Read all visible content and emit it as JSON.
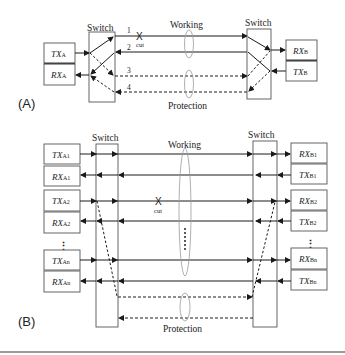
{
  "panel_a": {
    "label": "(A)",
    "switch_left_label": "Switch",
    "switch_right_label": "Switch",
    "working_label": "Working",
    "protection_label": "Protection",
    "cut_label": "cut",
    "cut_symbol": "X",
    "line_numbers": [
      "1",
      "2",
      "3",
      "4"
    ],
    "tx_a": {
      "main": "TX",
      "sub": "A"
    },
    "rx_a": {
      "main": "RX",
      "sub": "A"
    },
    "rx_b": {
      "main": "RX",
      "sub": "B"
    },
    "tx_b": {
      "main": "TX",
      "sub": "B"
    }
  },
  "panel_b": {
    "label": "(B)",
    "switch_left_label": "Switch",
    "switch_right_label": "Switch",
    "working_label": "Working",
    "protection_label": "Protection",
    "cut_label": "cut",
    "cut_symbol": "X",
    "left_units": [
      {
        "main": "TX",
        "sub": "A1"
      },
      {
        "main": "RX",
        "sub": "A1"
      },
      {
        "main": "TX",
        "sub": "A2"
      },
      {
        "main": "RX",
        "sub": "A2"
      },
      {
        "main": "TX",
        "sub": "An"
      },
      {
        "main": "RX",
        "sub": "An"
      }
    ],
    "right_units": [
      {
        "main": "RX",
        "sub": "B1"
      },
      {
        "main": "TX",
        "sub": "B1"
      },
      {
        "main": "RX",
        "sub": "B2"
      },
      {
        "main": "TX",
        "sub": "B2"
      },
      {
        "main": "RX",
        "sub": "Bn"
      },
      {
        "main": "TX",
        "sub": "Bn"
      }
    ],
    "ellipsis": "⋮"
  },
  "colors": {
    "line": "#1a1a1a",
    "box_border": "#555555",
    "ellipse": "#9a9a9a",
    "rule": "#9a9a9a"
  }
}
